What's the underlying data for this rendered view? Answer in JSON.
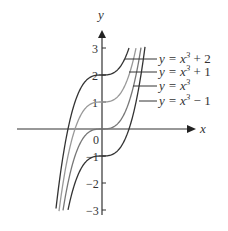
{
  "chart_data": {
    "type": "line",
    "title": "",
    "xlabel": "x",
    "ylabel": "y",
    "ylim": [
      -3,
      3
    ],
    "y_ticks": [
      "3",
      "2",
      "1",
      "0",
      "-1",
      "-2",
      "-3"
    ],
    "origin_label": "0",
    "grid": false,
    "series": [
      {
        "name": "y = x³ + 2",
        "shift": 2,
        "color": "#333333"
      },
      {
        "name": "y = x³ + 1",
        "shift": 1,
        "color": "#999999"
      },
      {
        "name": "y = x³",
        "shift": 0,
        "color": "#777777"
      },
      {
        "name": "y = x³ − 1",
        "shift": -1,
        "color": "#333333"
      }
    ]
  },
  "labels": {
    "x_axis": "x",
    "y_axis": "y",
    "s0": "y = x",
    "s0b": " + 2",
    "s1": "y = x",
    "s1b": " + 1",
    "s2": "y = x",
    "s3": "y = x",
    "s3b": " − 1",
    "sup": "3",
    "t3": "3",
    "t2": "2",
    "t1": "1",
    "t0": "0",
    "tm1": "−1",
    "tm2": "−2",
    "tm3": "−3"
  }
}
